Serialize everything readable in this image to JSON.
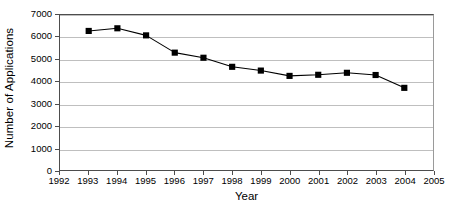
{
  "chart_data": {
    "type": "line",
    "title": "",
    "xlabel": "Year",
    "ylabel": "Number of Applications",
    "x": [
      1993,
      1994,
      1995,
      1996,
      1997,
      1998,
      1999,
      2000,
      2001,
      2002,
      2003,
      2004
    ],
    "values": [
      6280,
      6400,
      6080,
      5300,
      5070,
      4660,
      4490,
      4250,
      4300,
      4390,
      4290,
      3710
    ],
    "series": [
      {
        "name": "Number of Applications",
        "values": [
          6280,
          6400,
          6080,
          5300,
          5070,
          4660,
          4490,
          4250,
          4300,
          4390,
          4290,
          3710
        ]
      }
    ],
    "xlim": [
      1992,
      2005
    ],
    "ylim": [
      0,
      7000
    ],
    "x_tick_labels": [
      "1992",
      "1993",
      "1994",
      "1995",
      "1996",
      "1997",
      "1998",
      "1999",
      "2000",
      "2001",
      "2002",
      "2003",
      "2004",
      "2005"
    ],
    "x_ticks": [
      1992,
      1993,
      1994,
      1995,
      1996,
      1997,
      1998,
      1999,
      2000,
      2001,
      2002,
      2003,
      2004,
      2005
    ],
    "y_tick_labels": [
      "0",
      "1000",
      "2000",
      "3000",
      "4000",
      "5000",
      "6000",
      "7000"
    ],
    "y_ticks": [
      0,
      1000,
      2000,
      3000,
      4000,
      5000,
      6000,
      7000
    ],
    "grid": "horizontal",
    "legend": "none",
    "marker": "filled-square",
    "line_color": "#000000",
    "marker_color": "#000000",
    "gridline_color": "#bfbfbf",
    "plot_border_color": "#4d4d4d",
    "background_color": "#ffffff"
  }
}
